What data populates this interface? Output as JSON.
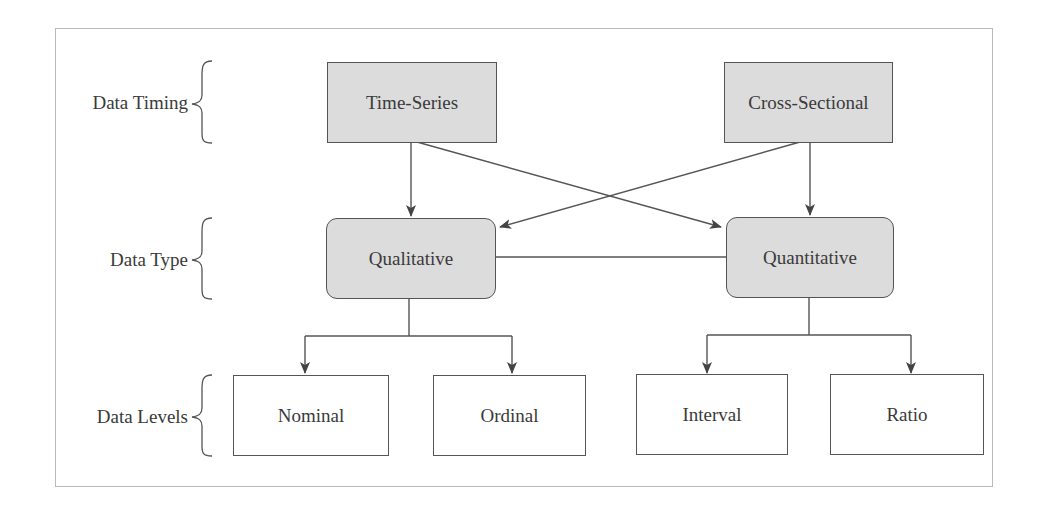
{
  "diagram": {
    "row_labels": [
      {
        "id": "timing",
        "label": "Data Timing"
      },
      {
        "id": "type",
        "label": "Data Type"
      },
      {
        "id": "levels",
        "label": "Data Levels"
      }
    ],
    "nodes": {
      "time_series": "Time-Series",
      "cross_sectional": "Cross-Sectional",
      "qualitative": "Qualitative",
      "quantitative": "Quantitative",
      "nominal": "Nominal",
      "ordinal": "Ordinal",
      "interval": "Interval",
      "ratio": "Ratio"
    },
    "edges": [
      {
        "from": "Time-Series",
        "to": "Qualitative",
        "type": "arrow"
      },
      {
        "from": "Time-Series",
        "to": "Quantitative",
        "type": "arrow"
      },
      {
        "from": "Cross-Sectional",
        "to": "Qualitative",
        "type": "arrow"
      },
      {
        "from": "Cross-Sectional",
        "to": "Quantitative",
        "type": "arrow"
      },
      {
        "from": "Qualitative",
        "to": "Quantitative",
        "type": "line"
      },
      {
        "from": "Qualitative",
        "to": "Nominal",
        "type": "arrow"
      },
      {
        "from": "Qualitative",
        "to": "Ordinal",
        "type": "arrow"
      },
      {
        "from": "Quantitative",
        "to": "Interval",
        "type": "arrow"
      },
      {
        "from": "Quantitative",
        "to": "Ratio",
        "type": "arrow"
      }
    ],
    "colors": {
      "gray_fill": "#dcdcdc",
      "stroke": "#555555",
      "frame": "#b9b9b9",
      "text": "#3a3a3a"
    }
  }
}
